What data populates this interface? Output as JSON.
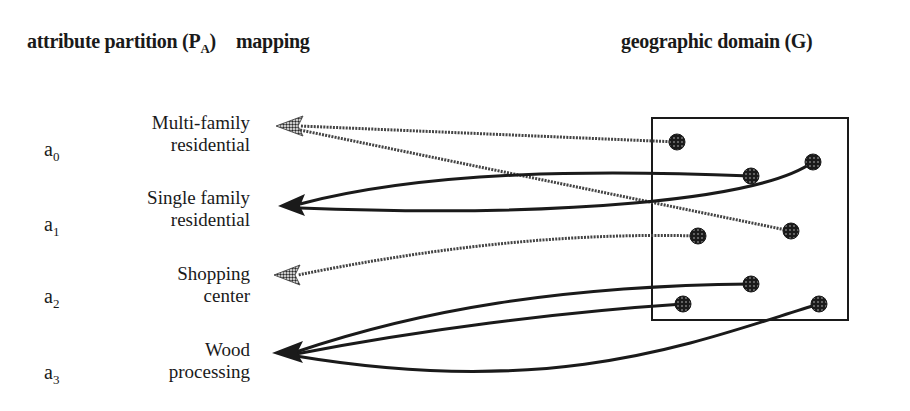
{
  "headers": {
    "left": "attribute partition (P",
    "left_sub": "A",
    "left_close": ")",
    "middle": "mapping",
    "right": "geographic domain (G)"
  },
  "attributes": [
    {
      "symbol": "a",
      "index": "0",
      "line1": "Multi-family",
      "line2": "residential",
      "line_style": "dotted"
    },
    {
      "symbol": "a",
      "index": "1",
      "line1": "Single family",
      "line2": "residential",
      "line_style": "solid"
    },
    {
      "symbol": "a",
      "index": "2",
      "line1": "Shopping",
      "line2": "center",
      "line_style": "dotted"
    },
    {
      "symbol": "a",
      "index": "3",
      "line1": "Wood",
      "line2": "processing",
      "line_style": "solid"
    }
  ],
  "geographic_points": [
    {
      "x": 677,
      "y": 142,
      "maps_to": "a0"
    },
    {
      "x": 751,
      "y": 176,
      "maps_to": "a1"
    },
    {
      "x": 813,
      "y": 162,
      "maps_to": "a1"
    },
    {
      "x": 791,
      "y": 231,
      "maps_to": "a0"
    },
    {
      "x": 698,
      "y": 236,
      "maps_to": "a2"
    },
    {
      "x": 751,
      "y": 284,
      "maps_to": "a3"
    },
    {
      "x": 683,
      "y": 304,
      "maps_to": "a3"
    },
    {
      "x": 819,
      "y": 304,
      "maps_to": "a3"
    }
  ],
  "colors": {
    "ink": "#1a1a1a",
    "dotted_ink": "#555555",
    "background": "#ffffff"
  }
}
